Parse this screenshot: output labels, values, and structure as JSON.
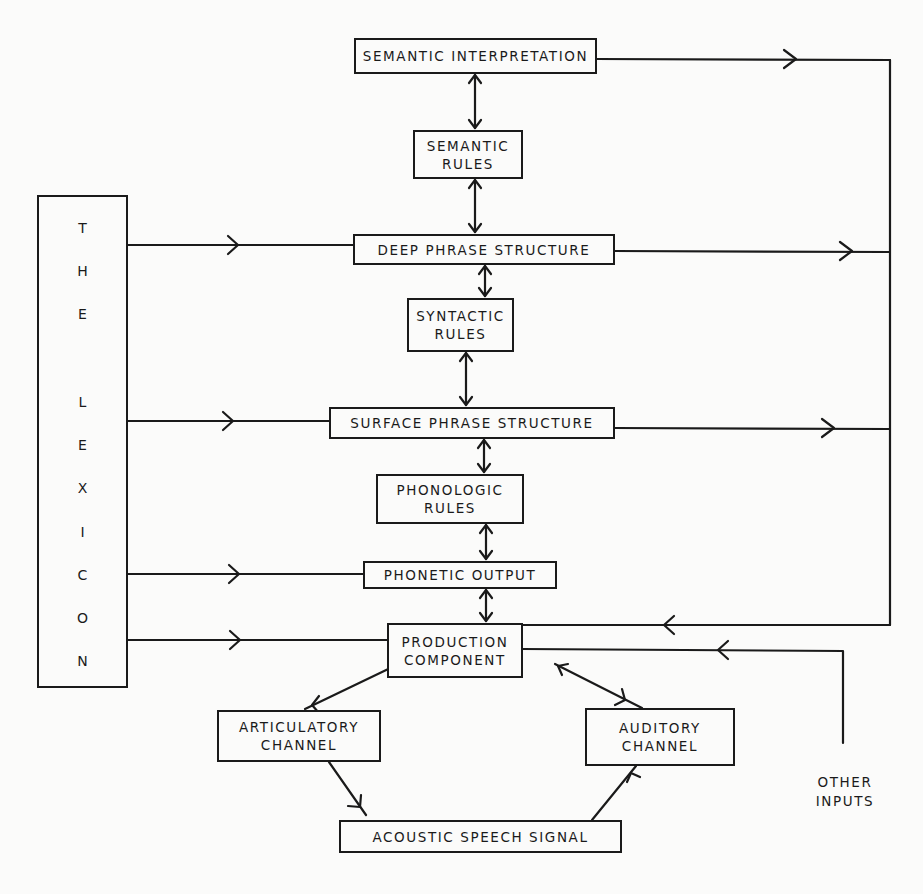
{
  "diagram": {
    "type": "flow-diagram",
    "lexicon": {
      "label": "THE LEXICON",
      "letters": [
        "T",
        "H",
        "E",
        "L",
        "E",
        "X",
        "I",
        "C",
        "O",
        "N"
      ]
    },
    "nodes": {
      "semantic_interpretation": {
        "lines": [
          "SEMANTIC INTERPRETATION"
        ]
      },
      "semantic_rules": {
        "lines": [
          "SEMANTIC",
          "RULES"
        ]
      },
      "deep_phrase_structure": {
        "lines": [
          "DEEP PHRASE STRUCTURE"
        ]
      },
      "syntactic_rules": {
        "lines": [
          "SYNTACTIC",
          "RULES"
        ]
      },
      "surface_phrase_structure": {
        "lines": [
          "SURFACE PHRASE STRUCTURE"
        ]
      },
      "phonologic_rules": {
        "lines": [
          "PHONOLOGIC",
          "RULES"
        ]
      },
      "phonetic_output": {
        "lines": [
          "PHONETIC OUTPUT"
        ]
      },
      "production_component": {
        "lines": [
          "PRODUCTION",
          "COMPONENT"
        ]
      },
      "articulatory_channel": {
        "lines": [
          "ARTICULATORY",
          "CHANNEL"
        ]
      },
      "auditory_channel": {
        "lines": [
          "AUDITORY",
          "CHANNEL"
        ]
      },
      "acoustic_speech_signal": {
        "lines": [
          "ACOUSTIC SPEECH SIGNAL"
        ]
      }
    },
    "other_inputs": {
      "lines": [
        "OTHER",
        "INPUTS"
      ]
    },
    "edges": [
      {
        "from": "semantic_interpretation",
        "to": "semantic_rules",
        "kind": "bidirectional"
      },
      {
        "from": "semantic_rules",
        "to": "deep_phrase_structure",
        "kind": "bidirectional"
      },
      {
        "from": "deep_phrase_structure",
        "to": "syntactic_rules",
        "kind": "bidirectional"
      },
      {
        "from": "syntactic_rules",
        "to": "surface_phrase_structure",
        "kind": "bidirectional"
      },
      {
        "from": "surface_phrase_structure",
        "to": "phonologic_rules",
        "kind": "bidirectional"
      },
      {
        "from": "phonologic_rules",
        "to": "phonetic_output",
        "kind": "bidirectional"
      },
      {
        "from": "phonetic_output",
        "to": "production_component",
        "kind": "bidirectional"
      },
      {
        "from": "lexicon",
        "to": "deep_phrase_structure",
        "kind": "directed"
      },
      {
        "from": "lexicon",
        "to": "surface_phrase_structure",
        "kind": "directed"
      },
      {
        "from": "lexicon",
        "to": "phonetic_output",
        "kind": "directed"
      },
      {
        "from": "lexicon",
        "to": "production_component",
        "kind": "directed"
      },
      {
        "from": "semantic_interpretation",
        "to": "production_component",
        "kind": "directed",
        "via": "right-bus"
      },
      {
        "from": "deep_phrase_structure",
        "to": "production_component",
        "kind": "directed",
        "via": "right-bus"
      },
      {
        "from": "surface_phrase_structure",
        "to": "production_component",
        "kind": "directed",
        "via": "right-bus"
      },
      {
        "from": "other_inputs",
        "to": "production_component",
        "kind": "directed"
      },
      {
        "from": "production_component",
        "to": "articulatory_channel",
        "kind": "bidirectional"
      },
      {
        "from": "production_component",
        "to": "auditory_channel",
        "kind": "bidirectional"
      },
      {
        "from": "articulatory_channel",
        "to": "acoustic_speech_signal",
        "kind": "directed"
      },
      {
        "from": "acoustic_speech_signal",
        "to": "auditory_channel",
        "kind": "directed"
      }
    ]
  }
}
